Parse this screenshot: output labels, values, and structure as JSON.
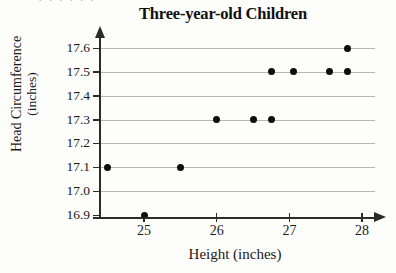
{
  "page": {
    "scan_artifact_text": "· ·   ·   ·  ·   ·"
  },
  "chart_data": {
    "type": "scatter",
    "title": "Three-year-old Children",
    "xlabel": "Height (inches)",
    "ylabel_line1": "Head Circumference",
    "ylabel_line2": "(inches)",
    "ylabel": "Head Circumference (inches)",
    "xlim": [
      24.35,
      28.2
    ],
    "ylim": [
      16.86,
      17.65
    ],
    "xticks": [
      25,
      26,
      27,
      28
    ],
    "xtick_labels": [
      "25",
      "26",
      "27",
      "28"
    ],
    "yticks": [
      16.9,
      17.0,
      17.1,
      17.2,
      17.3,
      17.4,
      17.5,
      17.6
    ],
    "ytick_labels": [
      "16.9",
      "17.0",
      "17.1",
      "17.2",
      "17.3",
      "17.4",
      "17.5",
      "17.6"
    ],
    "grid": "horizontal",
    "legend": "none",
    "marker": "filled-circle",
    "marker_color": "#0d0d0d",
    "point_count": 11,
    "x": [
      24.5,
      25.0,
      25.5,
      26.0,
      26.5,
      26.75,
      26.75,
      27.05,
      27.55,
      27.8,
      27.8
    ],
    "y": [
      17.1,
      16.9,
      17.1,
      17.3,
      17.3,
      17.3,
      17.5,
      17.5,
      17.5,
      17.5,
      17.6
    ],
    "points": [
      {
        "x": 24.5,
        "y": 17.1
      },
      {
        "x": 25.0,
        "y": 16.9
      },
      {
        "x": 25.5,
        "y": 17.1
      },
      {
        "x": 26.0,
        "y": 17.3
      },
      {
        "x": 26.5,
        "y": 17.3
      },
      {
        "x": 26.75,
        "y": 17.3
      },
      {
        "x": 26.75,
        "y": 17.5
      },
      {
        "x": 27.05,
        "y": 17.5
      },
      {
        "x": 27.55,
        "y": 17.5
      },
      {
        "x": 27.8,
        "y": 17.5
      },
      {
        "x": 27.8,
        "y": 17.6
      }
    ]
  }
}
